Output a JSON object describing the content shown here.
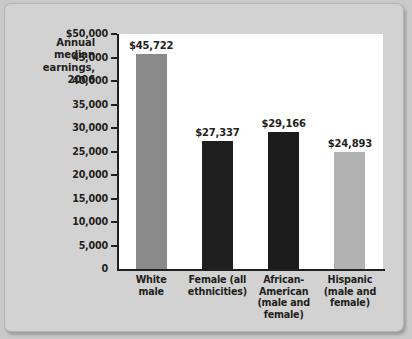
{
  "chart_data": {
    "type": "bar",
    "title": "",
    "ylabel": "Annual median earnings, 2006",
    "xlabel": "",
    "ylim": [
      0,
      50000
    ],
    "grid": false,
    "legend": "none",
    "categories": [
      "White male",
      "Female (all ethnicities)",
      "African-American (male and female)",
      "Hispanic (male and female)"
    ],
    "category_lines": [
      [
        "White",
        "male"
      ],
      [
        "Female (all",
        "ethnicities)"
      ],
      [
        "African-",
        "American",
        "(male and",
        "female)"
      ],
      [
        "Hispanic",
        "(male and",
        "female)"
      ]
    ],
    "values": [
      45722,
      27337,
      29166,
      24893
    ],
    "value_labels": [
      "$45,722",
      "$27,337",
      "$29,166",
      "$24,893"
    ],
    "bar_colors": [
      "#8a8a8a",
      "#1f1f1f",
      "#1c1c1c",
      "#b2b2b2"
    ],
    "ytick_values": [
      50000,
      45000,
      40000,
      35000,
      30000,
      25000,
      20000,
      15000,
      10000,
      5000,
      0
    ],
    "ytick_labels": [
      "$50,000",
      "45,000",
      "40,000",
      "35,000",
      "30,000",
      "25,000",
      "20,000",
      "15,000",
      "10,000",
      "5,000",
      "0"
    ]
  },
  "axis_title_lines": [
    "Annual",
    "median",
    "earnings,",
    "2006"
  ],
  "colors": {
    "page_background": "#c9c9c9",
    "card_background": "#d2d2d2",
    "plot_background": "#ffffff",
    "axis": "#231f20",
    "text": "#231f20"
  }
}
